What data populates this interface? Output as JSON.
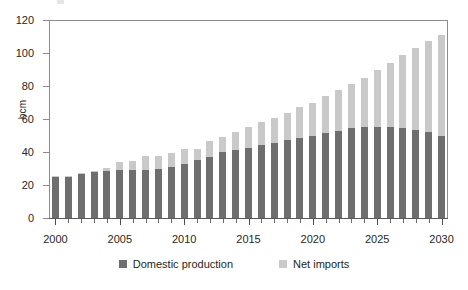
{
  "chart_data": {
    "type": "bar",
    "subtype": "stacked-vertical",
    "title": "",
    "xlabel": "",
    "ylabel": "bcm",
    "ylim": [
      0,
      120
    ],
    "ytick_labels": [
      "0",
      "20",
      "40",
      "60",
      "80",
      "100",
      "120"
    ],
    "ytick_values": [
      0,
      20,
      40,
      60,
      80,
      100,
      120
    ],
    "xtick_labels": [
      "2000",
      "2005",
      "2010",
      "2015",
      "2020",
      "2025",
      "2030"
    ],
    "xtick_values": [
      2000,
      2005,
      2010,
      2015,
      2020,
      2025,
      2030
    ],
    "grid": false,
    "legend_position": "bottom-center",
    "categories": [
      2000,
      2001,
      2002,
      2003,
      2004,
      2005,
      2006,
      2007,
      2008,
      2009,
      2010,
      2011,
      2012,
      2013,
      2014,
      2015,
      2016,
      2017,
      2018,
      2019,
      2020,
      2021,
      2022,
      2023,
      2024,
      2025,
      2026,
      2027,
      2028,
      2029,
      2030
    ],
    "series": [
      {
        "name": "Domestic production",
        "color": "#6e6e6e",
        "values": [
          25,
          25,
          27,
          28,
          28.5,
          29,
          29,
          29,
          30,
          31,
          32.5,
          35,
          37,
          40,
          41,
          42.5,
          44,
          45.5,
          47,
          48.5,
          50,
          51.5,
          53,
          54.5,
          55,
          55,
          55,
          54.5,
          53.5,
          52,
          50
        ]
      },
      {
        "name": "Net imports",
        "color": "#c9c9c9",
        "values": [
          0.5,
          0.5,
          0.5,
          0.5,
          2,
          5,
          5.5,
          8.5,
          7.5,
          8.5,
          9.5,
          7,
          9.5,
          9,
          11,
          12.5,
          14,
          15,
          16.5,
          18.5,
          19.5,
          22.5,
          24.5,
          27,
          30,
          34.5,
          39,
          44,
          49.5,
          55,
          61
        ]
      }
    ],
    "totals": [
      25.5,
      25.5,
      27.5,
      28.5,
      30.5,
      34,
      34.5,
      37.5,
      37.5,
      39.5,
      42,
      42,
      46.5,
      49,
      52,
      55,
      58,
      60.5,
      63.5,
      67,
      69.5,
      74,
      77.5,
      81.5,
      85,
      89.5,
      94,
      98.5,
      103,
      107,
      111
    ]
  },
  "legend": {
    "items": [
      {
        "label": "Domestic production",
        "color": "#6e6e6e"
      },
      {
        "label": "Net imports",
        "color": "#c9c9c9"
      }
    ]
  },
  "axis": {
    "y_title": "bcm"
  }
}
